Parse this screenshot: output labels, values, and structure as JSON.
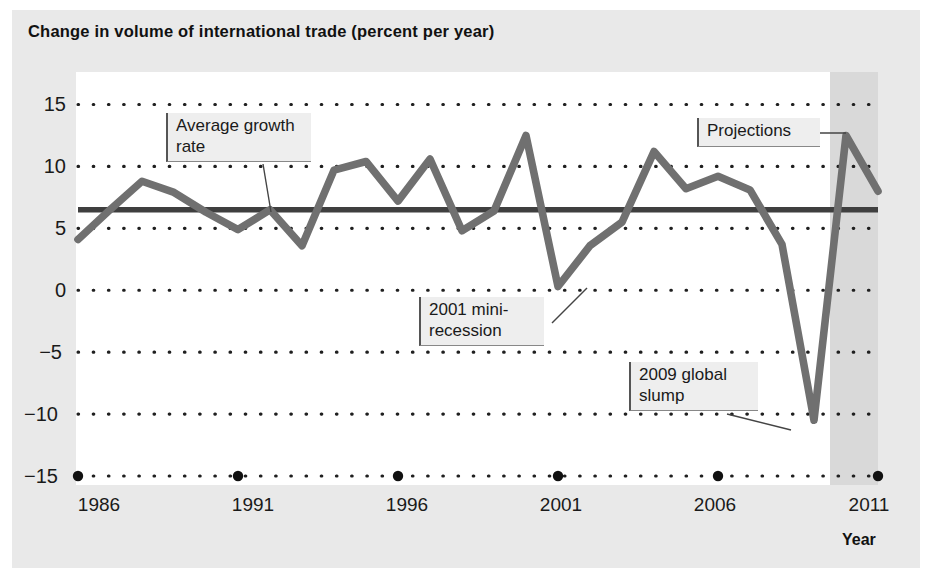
{
  "figure": {
    "title": "Change in volume of international trade (percent per year)",
    "axis_label_x": "Year",
    "colors": {
      "figure_background": "#e9e9e9",
      "plot_background": "#ffffff",
      "data_line": "#6e6e6e",
      "average_line": "#3a3a3a",
      "gridline": "#222222",
      "projection_band": "#d8d8d8",
      "callout_background": "#eeeeee"
    }
  },
  "chart_data": {
    "type": "line",
    "title": "Change in volume of international trade (percent per year)",
    "xlabel": "Year",
    "ylabel": "",
    "xlim": [
      1986,
      2011
    ],
    "ylim": [
      -15,
      15
    ],
    "grid": true,
    "legend_position": "none",
    "x_tick_labels": [
      "1986",
      "1991",
      "1996",
      "2001",
      "2006",
      "2011"
    ],
    "x_ticks": [
      1986,
      1991,
      1996,
      2001,
      2006,
      2011
    ],
    "y_tick_labels": [
      "15",
      "10",
      "5",
      "0",
      "−5",
      "−10",
      "−15"
    ],
    "y_ticks": [
      15,
      10,
      5,
      0,
      -5,
      -10,
      -15
    ],
    "x": [
      1986,
      1987,
      1988,
      1989,
      1990,
      1991,
      1992,
      1993,
      1994,
      1995,
      1996,
      1997,
      1998,
      1999,
      2000,
      2001,
      2002,
      2003,
      2004,
      2005,
      2006,
      2007,
      2008,
      2009,
      2010,
      2011
    ],
    "series": [
      {
        "name": "Change in volume of international trade",
        "values": [
          4.1,
          6.5,
          8.8,
          7.9,
          6.3,
          4.9,
          6.5,
          3.6,
          9.7,
          10.4,
          7.2,
          10.6,
          4.8,
          6.4,
          12.5,
          0.3,
          3.6,
          5.5,
          11.2,
          8.2,
          9.2,
          8.1,
          3.7,
          -10.5,
          12.5,
          8.0
        ]
      },
      {
        "name": "Average growth rate",
        "type": "reference_line",
        "value": 6.5
      }
    ],
    "shaded_region": {
      "label": "Projections",
      "x_start": 2009.5,
      "x_end": 2011.0
    },
    "annotations": [
      {
        "id": "average-growth-rate",
        "text": "Average growth\nrate"
      },
      {
        "id": "projections",
        "text": "Projections"
      },
      {
        "id": "mini-recession-2001",
        "text": "2001 mini-\nrecession"
      },
      {
        "id": "global-slump-2009",
        "text": "2009 global\nslump"
      }
    ]
  }
}
